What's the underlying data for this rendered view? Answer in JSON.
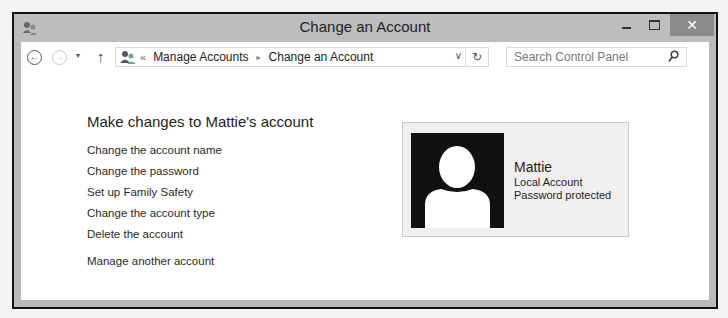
{
  "window": {
    "title": "Change an Account",
    "controls": {
      "minimize": "–",
      "maximize": "☐",
      "close": "✕"
    },
    "accent_close_color": "#8c8c8c"
  },
  "navbar": {
    "back_icon": "←",
    "forward_icon": "→",
    "recent_icon": "▾",
    "up_icon": "↑",
    "address": {
      "chevron": "«",
      "breadcrumbs": [
        "Manage Accounts",
        "Change an Account"
      ],
      "separator": "▸",
      "dropdown_icon": "∨",
      "refresh_icon": "↻"
    },
    "search": {
      "placeholder": "Search Control Panel",
      "icon": "⚲"
    }
  },
  "main": {
    "heading": "Make changes to Mattie's account",
    "tasks": [
      "Change the account name",
      "Change the password",
      "Set up Family Safety",
      "Change the account type",
      "Delete the account"
    ],
    "other_task": "Manage another account"
  },
  "account": {
    "name": "Mattie",
    "type": "Local Account",
    "status": "Password protected"
  }
}
